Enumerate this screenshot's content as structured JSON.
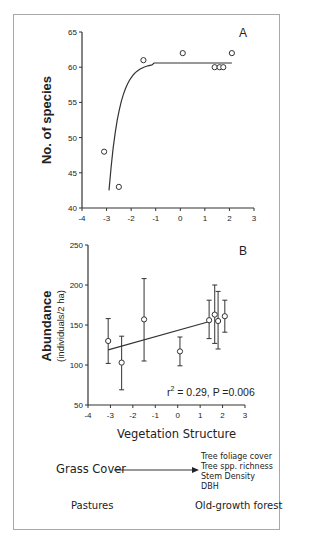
{
  "chart_data": [
    {
      "type": "scatter",
      "panel_label": "A",
      "title": "",
      "xlabel": "",
      "ylabel": "No. of species",
      "xlim": [
        -4,
        3
      ],
      "ylim": [
        40,
        65
      ],
      "xticks": [
        "-4",
        "-3",
        "-2",
        "-1",
        "0",
        "1",
        "2",
        "3"
      ],
      "yticks": [
        "40",
        "45",
        "50",
        "55",
        "60",
        "65"
      ],
      "points": [
        {
          "x": -3.1,
          "y": 48
        },
        {
          "x": -2.5,
          "y": 43
        },
        {
          "x": -1.5,
          "y": 61
        },
        {
          "x": 0.1,
          "y": 62
        },
        {
          "x": 1.4,
          "y": 60
        },
        {
          "x": 1.6,
          "y": 60
        },
        {
          "x": 1.75,
          "y": 60
        },
        {
          "x": 2.1,
          "y": 62
        }
      ],
      "fit": "asymptotic curve rising from ~42.5 at x=-2.9 to plateau ~60.6"
    },
    {
      "type": "scatter",
      "panel_label": "B",
      "xlabel": "Vegetation Structure",
      "ylabel": "Abundance",
      "ylabel_sub": "(individuals/2 ha)",
      "xlim": [
        -4,
        3
      ],
      "ylim": [
        50,
        250
      ],
      "xticks": [
        "-4",
        "-3",
        "-2",
        "-1",
        "0",
        "1",
        "2",
        "3"
      ],
      "yticks": [
        "50",
        "100",
        "150",
        "200",
        "250"
      ],
      "points": [
        {
          "x": -3.1,
          "y": 130,
          "err_low": 102,
          "err_high": 158
        },
        {
          "x": -2.5,
          "y": 103,
          "err_low": 69,
          "err_high": 136
        },
        {
          "x": -1.5,
          "y": 157,
          "err_low": 105,
          "err_high": 208
        },
        {
          "x": 0.1,
          "y": 117,
          "err_low": 99,
          "err_high": 135
        },
        {
          "x": 1.4,
          "y": 156,
          "err_low": 133,
          "err_high": 181
        },
        {
          "x": 1.65,
          "y": 163,
          "err_low": 127,
          "err_high": 200
        },
        {
          "x": 1.8,
          "y": 155,
          "err_low": 120,
          "err_high": 192
        },
        {
          "x": 2.1,
          "y": 161,
          "err_low": 141,
          "err_high": 181
        }
      ],
      "fit": {
        "x1": -3.1,
        "y1": 119,
        "x2": 1.5,
        "y2": 155
      },
      "annotation": "r² = 0.29, P =0.006"
    }
  ],
  "legend": {
    "gradient_start": "Grass Cover",
    "gradient_end_items": [
      "Tree foliage cover",
      "Tree spp. richness",
      "Stem Density",
      "DBH"
    ],
    "left_label": "Pastures",
    "right_label": "Old-growth forest"
  },
  "labels": {
    "a_panel": "A",
    "b_panel": "B",
    "a_ylabel": "No. of species",
    "b_ylabel": "Abundance",
    "b_ylabel_sub": "(individuals/2 ha)",
    "b_xlabel": "Vegetation Structure",
    "b_annot_r": "r",
    "b_annot_sup": "2",
    "b_annot_rest": " = 0.29, P =0.006"
  }
}
